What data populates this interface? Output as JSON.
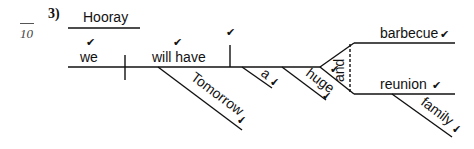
{
  "question": {
    "number": "3)",
    "score_denominator": "10"
  },
  "diagram": {
    "interjection": "Hooray",
    "subject": "we",
    "verb": "will have",
    "adverb": "Tomorrow",
    "modifier_a": "a",
    "modifier_huge": "huge",
    "conjunction": "and",
    "object_1": "barbecue",
    "object_2": "reunion",
    "modifier_family": "family",
    "check": "✔"
  }
}
